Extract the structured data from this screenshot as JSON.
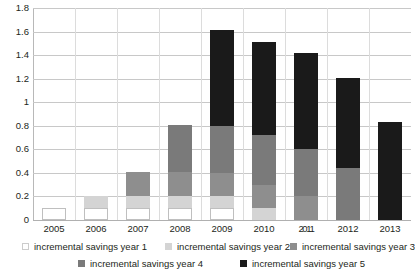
{
  "chart_data": {
    "type": "bar",
    "stacked": true,
    "title": "",
    "xlabel": "",
    "ylabel": "",
    "ylim": [
      0,
      1.8
    ],
    "yticks": [
      "0",
      "0.2",
      "0.4",
      "0.6",
      "0.8",
      "1",
      "1.2",
      "1.4",
      "1.6",
      "1.8"
    ],
    "ytick_values": [
      0,
      0.2,
      0.4,
      0.6,
      0.8,
      1.0,
      1.2,
      1.4,
      1.6,
      1.8
    ],
    "grid": true,
    "legend_position": "bottom",
    "categories": [
      "2005",
      "2006",
      "2007",
      "2008",
      "2009",
      "2010",
      "2011",
      "2012",
      "2013"
    ],
    "category_labels_rendered": [
      "2005",
      "2006",
      "2007",
      "2008",
      "2009",
      "2010",
      "2011",
      "2012",
      "2013"
    ],
    "series": [
      {
        "name": "incremental savings year 1",
        "color": "#ffffff",
        "values": [
          0.1,
          0.1,
          0.1,
          0.1,
          0.1,
          0.0,
          0.0,
          0.0,
          0.0
        ]
      },
      {
        "name": "incremental savings year 2",
        "color": "#d4d4d4",
        "values": [
          0.0,
          0.1,
          0.1,
          0.1,
          0.1,
          0.1,
          0.0,
          0.0,
          0.0
        ]
      },
      {
        "name": "incremental savings year 3",
        "color": "#8e8e8e",
        "values": [
          0.0,
          0.0,
          0.21,
          0.21,
          0.2,
          0.2,
          0.2,
          0.0,
          0.0
        ]
      },
      {
        "name": "incremental savings year 4",
        "color": "#7a7a7a",
        "values": [
          0.0,
          0.0,
          0.0,
          0.4,
          0.4,
          0.42,
          0.4,
          0.44,
          0.0
        ]
      },
      {
        "name": "incremental savings year 5",
        "color": "#1a1a1a",
        "values": [
          0.0,
          0.0,
          0.0,
          0.0,
          0.81,
          0.79,
          0.82,
          0.77,
          0.83
        ]
      }
    ],
    "totals": [
      0.1,
      0.2,
      0.41,
      0.81,
      1.61,
      1.51,
      1.42,
      1.21,
      0.83
    ]
  },
  "legend": {
    "items": [
      {
        "label": "incremental savings year 1",
        "swatch": "y1"
      },
      {
        "label": "incremental savings year 2",
        "swatch": "y2"
      },
      {
        "label": "incremental savings year 3",
        "swatch": "y3"
      },
      {
        "label": "incremental savings year 4",
        "swatch": "y4"
      },
      {
        "label": "incremental savings year 5",
        "swatch": "y5"
      }
    ]
  }
}
